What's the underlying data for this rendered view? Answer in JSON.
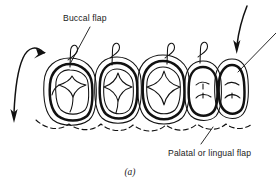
{
  "figure": {
    "caption": "(a)",
    "labels": {
      "buccal_flap": "Buccal flap",
      "palatal_or_lingual_flap": "Palatal or lingual flap"
    },
    "colors": {
      "ink": "#111111",
      "background": "#ffffff",
      "text": "#1a1a1a"
    },
    "teeth": [
      {
        "id": "tooth-1",
        "type": "molar",
        "cx": 70,
        "cy": 91,
        "rx": 26,
        "ry": 33
      },
      {
        "id": "tooth-2",
        "type": "molar",
        "cx": 117,
        "cy": 89,
        "rx": 24,
        "ry": 32
      },
      {
        "id": "tooth-3",
        "type": "molar",
        "cx": 163,
        "cy": 88,
        "rx": 27,
        "ry": 33
      },
      {
        "id": "tooth-4",
        "type": "premolar",
        "cx": 203,
        "cy": 90,
        "rx": 19,
        "ry": 29
      },
      {
        "id": "tooth-5",
        "type": "premolar",
        "cx": 232,
        "cy": 89,
        "rx": 17,
        "ry": 28
      }
    ],
    "sutures": [
      {
        "id": "suture-1",
        "x": 71,
        "y": 50
      },
      {
        "id": "suture-2",
        "x": 113,
        "y": 48
      },
      {
        "id": "suture-3",
        "x": 168,
        "y": 48
      },
      {
        "id": "suture-4",
        "x": 201,
        "y": 47
      }
    ],
    "arrows": [
      {
        "id": "arrow-buccal-reflection-left",
        "direction": "down-left",
        "tip_x": 14,
        "tip_y": 121
      },
      {
        "id": "arrow-flap-replacement-right",
        "direction": "down-left",
        "tip_x": 237,
        "tip_y": 52
      }
    ],
    "leaders": [
      {
        "id": "leader-buccal-flap",
        "from_x": 90,
        "from_y": 28,
        "to_x": 71,
        "to_y": 64
      },
      {
        "id": "leader-palatal-flap",
        "from_x": 200,
        "from_y": 145,
        "to_x": 213,
        "to_y": 126
      },
      {
        "id": "leader-right-edge",
        "from_x": 276,
        "from_y": 33,
        "to_x": 238,
        "to_y": 72
      }
    ]
  }
}
